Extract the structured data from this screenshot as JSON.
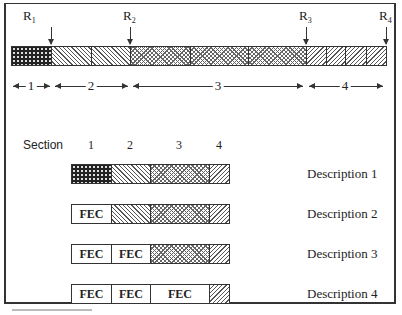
{
  "diagram": {
    "markers": [
      {
        "label": "R",
        "sub": "1",
        "x": 51
      },
      {
        "label": "R",
        "sub": "2",
        "x": 130
      },
      {
        "label": "R",
        "sub": "3",
        "x": 306
      },
      {
        "label": "R",
        "sub": "4",
        "x": 386
      }
    ],
    "top_bar": {
      "segments": [
        {
          "pattern": "dots",
          "width": 40
        },
        {
          "pattern": "back",
          "width": 40
        },
        {
          "pattern": "back",
          "width": 39
        },
        {
          "pattern": "cross",
          "width": 60
        },
        {
          "pattern": "cross",
          "width": 58
        },
        {
          "pattern": "cross",
          "width": 58
        },
        {
          "pattern": "fwd",
          "width": 20
        },
        {
          "pattern": "fwd",
          "width": 19
        },
        {
          "pattern": "fwd",
          "width": 21
        },
        {
          "pattern": "fwd",
          "width": 20
        }
      ]
    },
    "spans": [
      {
        "label": "1",
        "from": 13,
        "to": 50
      },
      {
        "label": "2",
        "from": 55,
        "to": 128
      },
      {
        "label": "3",
        "from": 133,
        "to": 303
      },
      {
        "label": "4",
        "from": 309,
        "to": 383
      }
    ],
    "section_header": "Section",
    "section_numbers": [
      {
        "label": "1",
        "x": 91
      },
      {
        "label": "2",
        "x": 130
      },
      {
        "label": "3",
        "x": 179
      },
      {
        "label": "4",
        "x": 219
      }
    ],
    "fec_label": "FEC",
    "rows": [
      {
        "description": "Description 1",
        "cells": [
          "dots",
          "back",
          "cross",
          "fwd"
        ]
      },
      {
        "description": "Description 2",
        "cells": [
          "fec",
          "back",
          "cross",
          "fwd"
        ]
      },
      {
        "description": "Description 3",
        "cells": [
          "fec",
          "fec",
          "cross",
          "fwd"
        ]
      },
      {
        "description": "Description 4",
        "cells": [
          "fec",
          "fec",
          "fec",
          "fwd"
        ]
      }
    ]
  }
}
